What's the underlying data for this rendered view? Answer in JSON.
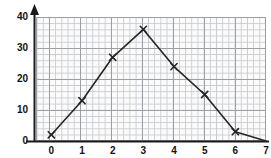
{
  "chart_data": {
    "type": "line",
    "title": "",
    "subtitle": "",
    "xlabel": "",
    "ylabel": "",
    "x": [
      0,
      1,
      2,
      3,
      4,
      5,
      6,
      7
    ],
    "values": [
      2,
      13,
      27,
      36,
      24,
      15,
      3,
      0
    ],
    "series": [
      {
        "name": "",
        "x": [
          0,
          1,
          2,
          3,
          4,
          5,
          6,
          7
        ],
        "values": [
          2,
          13,
          27,
          36,
          24,
          15,
          3,
          0
        ]
      }
    ],
    "xlim": [
      -0.5,
      7.0
    ],
    "ylim": [
      0,
      40
    ],
    "x_ticks": [
      0,
      1,
      2,
      3,
      4,
      5,
      6,
      7
    ],
    "x_tick_labels": [
      "0",
      "1",
      "2",
      "3",
      "4",
      "5",
      "6",
      "7"
    ],
    "y_ticks": [
      0,
      10,
      20,
      30,
      40
    ],
    "y_tick_labels": [
      "0",
      "10",
      "20",
      "30",
      "40"
    ],
    "grid": true,
    "grid_style": "graph-paper",
    "legend": false,
    "legend_position": "none",
    "marker": "x",
    "line_color": "#262626",
    "marker_color": "#262626",
    "grid_minor_color": "#c9ccd1",
    "grid_major_color": "#9aa0a6",
    "plot_background": "#fbfbfb",
    "axis_color": "#1a1a1a",
    "axis_arrows": [
      "y-up",
      "x-right"
    ]
  }
}
